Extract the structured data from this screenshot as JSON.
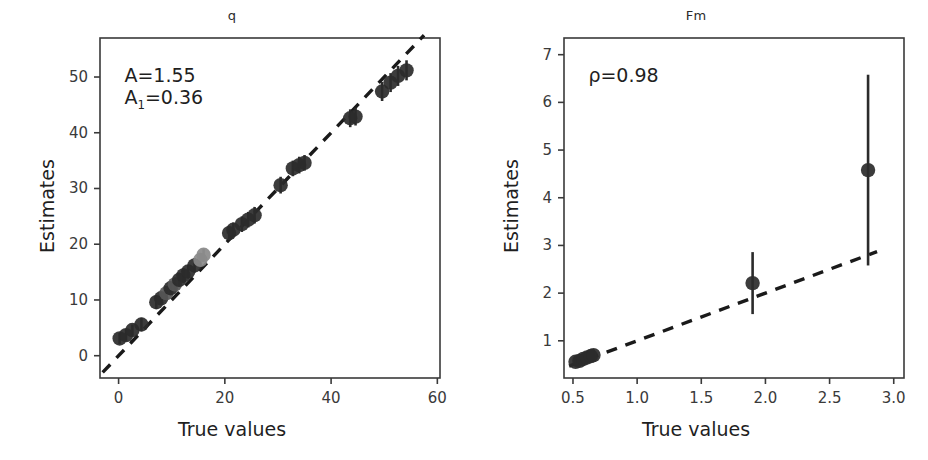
{
  "figure": {
    "width": 928,
    "height": 460,
    "background": "#ffffff",
    "shared_xlabel": "True values",
    "shared_ylabel": "Estimates",
    "marker_color": "#2b2b2b",
    "marker_color_light": "#8a8a8a",
    "refline_color": "#1a1a1a",
    "axis_color": "#3a3a3a"
  },
  "chart_data": [
    {
      "type": "scatter",
      "title": "q",
      "xlabel": "True values",
      "ylabel": "Estimates",
      "xlim": [
        -3.5,
        60.5
      ],
      "ylim": [
        -4.0,
        57.0
      ],
      "xticks": [
        0,
        20,
        40,
        60
      ],
      "xticklabels": [
        "0",
        "20",
        "40",
        "60"
      ],
      "yticks": [
        0,
        10,
        20,
        30,
        40,
        50
      ],
      "yticklabels": [
        "0",
        "10",
        "20",
        "30",
        "40",
        "50"
      ],
      "grid": false,
      "legend": "none",
      "annotations": [
        {
          "text": "A=1.55",
          "x": 0.06,
          "y": 0.9
        },
        {
          "text": "A",
          "sub": "1",
          "text_after": "=0.36",
          "x": 0.06,
          "y": 0.81
        }
      ],
      "reference_line": {
        "style": "dashed",
        "slope": 1.0,
        "intercept": 0.0,
        "x_from": -3.0,
        "x_to": 57.5
      },
      "points": [
        {
          "x": 0.2,
          "y": 3.1,
          "yerr": 1.0,
          "shade": "dark"
        },
        {
          "x": 1.4,
          "y": 3.7,
          "yerr": 1.1,
          "shade": "dark"
        },
        {
          "x": 2.6,
          "y": 4.6,
          "yerr": 1.0,
          "shade": "dark"
        },
        {
          "x": 4.3,
          "y": 5.6,
          "yerr": 1.2,
          "shade": "dark"
        },
        {
          "x": 7.1,
          "y": 9.6,
          "yerr": 1.2,
          "shade": "dark"
        },
        {
          "x": 8.0,
          "y": 10.3,
          "yerr": 1.1,
          "shade": "dark"
        },
        {
          "x": 9.0,
          "y": 11.2,
          "yerr": 1.3,
          "shade": "mid"
        },
        {
          "x": 9.8,
          "y": 12.1,
          "yerr": 1.2,
          "shade": "dark"
        },
        {
          "x": 10.6,
          "y": 12.8,
          "yerr": 1.2,
          "shade": "mid"
        },
        {
          "x": 11.4,
          "y": 13.6,
          "yerr": 1.3,
          "shade": "dark"
        },
        {
          "x": 12.2,
          "y": 14.4,
          "yerr": 1.3,
          "shade": "dark"
        },
        {
          "x": 13.1,
          "y": 15.1,
          "yerr": 1.2,
          "shade": "dark"
        },
        {
          "x": 14.3,
          "y": 16.2,
          "yerr": 1.3,
          "shade": "dark"
        },
        {
          "x": 15.4,
          "y": 17.2,
          "yerr": 1.2,
          "shade": "light"
        },
        {
          "x": 16.0,
          "y": 18.1,
          "yerr": 1.1,
          "shade": "light"
        },
        {
          "x": 20.8,
          "y": 22.0,
          "yerr": 1.3,
          "shade": "dark"
        },
        {
          "x": 21.6,
          "y": 22.6,
          "yerr": 1.3,
          "shade": "dark"
        },
        {
          "x": 23.2,
          "y": 23.6,
          "yerr": 1.4,
          "shade": "dark"
        },
        {
          "x": 24.4,
          "y": 24.4,
          "yerr": 1.4,
          "shade": "dark"
        },
        {
          "x": 25.6,
          "y": 25.2,
          "yerr": 1.5,
          "shade": "dark"
        },
        {
          "x": 30.5,
          "y": 30.6,
          "yerr": 1.5,
          "shade": "dark"
        },
        {
          "x": 32.8,
          "y": 33.6,
          "yerr": 1.4,
          "shade": "dark"
        },
        {
          "x": 34.0,
          "y": 34.2,
          "yerr": 1.5,
          "shade": "dark"
        },
        {
          "x": 35.0,
          "y": 34.6,
          "yerr": 1.4,
          "shade": "dark"
        },
        {
          "x": 43.6,
          "y": 42.6,
          "yerr": 1.6,
          "shade": "dark"
        },
        {
          "x": 44.6,
          "y": 42.9,
          "yerr": 1.6,
          "shade": "dark"
        },
        {
          "x": 49.6,
          "y": 47.4,
          "yerr": 1.7,
          "shade": "dark"
        },
        {
          "x": 51.2,
          "y": 49.0,
          "yerr": 1.7,
          "shade": "dark"
        },
        {
          "x": 52.6,
          "y": 50.2,
          "yerr": 1.8,
          "shade": "dark"
        },
        {
          "x": 54.2,
          "y": 51.2,
          "yerr": 1.8,
          "shade": "dark"
        }
      ]
    },
    {
      "type": "scatter",
      "title": "Fm",
      "xlabel": "True values",
      "ylabel": "Estimates",
      "xlim": [
        0.43,
        3.08
      ],
      "ylim": [
        0.22,
        7.35
      ],
      "xticks": [
        0.5,
        1.0,
        1.5,
        2.0,
        2.5,
        3.0
      ],
      "xticklabels": [
        "0.5",
        "1.0",
        "1.5",
        "2.0",
        "2.5",
        "3.0"
      ],
      "yticks": [
        1,
        2,
        3,
        4,
        5,
        6,
        7
      ],
      "yticklabels": [
        "1",
        "2",
        "3",
        "4",
        "5",
        "6",
        "7"
      ],
      "grid": false,
      "legend": "none",
      "annotations": [
        {
          "text": "ρ=0.98",
          "x": 0.06,
          "y": 0.9
        }
      ],
      "reference_line": {
        "style": "dashed",
        "slope": 1.0,
        "intercept": 0.0,
        "x_from": 0.47,
        "x_to": 2.87
      },
      "points": [
        {
          "x": 0.52,
          "y": 0.56,
          "yerr": 0.1,
          "shade": "dark"
        },
        {
          "x": 0.55,
          "y": 0.58,
          "yerr": 0.1,
          "shade": "dark"
        },
        {
          "x": 0.58,
          "y": 0.62,
          "yerr": 0.11,
          "shade": "dark"
        },
        {
          "x": 0.61,
          "y": 0.65,
          "yerr": 0.12,
          "shade": "dark"
        },
        {
          "x": 0.64,
          "y": 0.68,
          "yerr": 0.13,
          "shade": "dark"
        },
        {
          "x": 0.66,
          "y": 0.7,
          "yerr": 0.12,
          "shade": "dark"
        },
        {
          "x": 1.9,
          "y": 2.21,
          "yerr": 0.65,
          "shade": "dark"
        },
        {
          "x": 2.8,
          "y": 4.58,
          "yerr": 2.0,
          "shade": "dark"
        }
      ]
    }
  ]
}
